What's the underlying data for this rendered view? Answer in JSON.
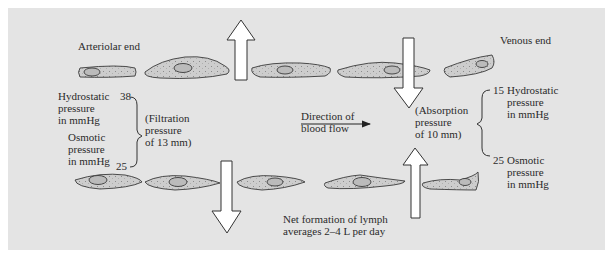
{
  "diagram": {
    "labels": {
      "arteriolar_end": "Arteriolar end",
      "venous_end": "Venous end",
      "left_hydrostatic": "Hydrostatic\npressure\nin mmHg",
      "left_hydrostatic_value": "38",
      "left_osmotic": "Osmotic\npressure\nin mmHg",
      "left_osmotic_value": "25",
      "filtration": "(Filtration\npressure\nof 13 mm)",
      "direction": "Direction of\nblood flow",
      "absorption": "(Absorption\npressure\nof 10 mm)",
      "right_hydrostatic_value": "15",
      "right_hydrostatic": "Hydrostatic\npressure\nin mmHg",
      "right_osmotic_value": "25",
      "right_osmotic": "Osmotic\npressure\nin mmHg",
      "lymph": "Net formation of lymph\naverages 2–4 L per day"
    },
    "colors": {
      "background": "#e4e4e4",
      "cell_fill": "#c9c9c9",
      "outline": "#3a3a3a",
      "arrow_fill": "#ffffff"
    }
  }
}
